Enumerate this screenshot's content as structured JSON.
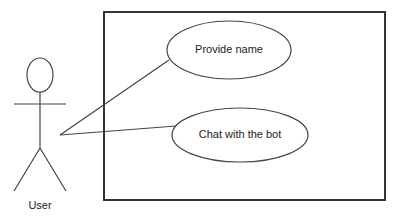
{
  "diagram": {
    "type": "use-case",
    "system_boundary": {
      "x": 104,
      "y": 12,
      "width": 281,
      "height": 188
    },
    "actor": {
      "label": "User",
      "head": {
        "cx": 40,
        "cy": 75,
        "rx": 13,
        "ry": 17
      },
      "arms": {
        "x1": 14,
        "y1": 104,
        "x2": 66,
        "y2": 104
      },
      "body": {
        "x1": 40,
        "y1": 92,
        "x2": 40,
        "y2": 148
      },
      "left_leg": {
        "x1": 40,
        "y1": 148,
        "x2": 14,
        "y2": 191
      },
      "right_leg": {
        "x1": 40,
        "y1": 148,
        "x2": 66,
        "y2": 191
      }
    },
    "use_cases": [
      {
        "label": "Provide name",
        "cx": 229,
        "cy": 50,
        "rx": 62,
        "ry": 29
      },
      {
        "label": "Chat with the bot",
        "cx": 240,
        "cy": 135,
        "rx": 68,
        "ry": 27
      }
    ],
    "associations": [
      {
        "from": "User",
        "to": "Provide name",
        "x1": 60,
        "y1": 135,
        "x2": 169,
        "y2": 60
      },
      {
        "from": "User",
        "to": "Chat with the bot",
        "x1": 60,
        "y1": 135,
        "x2": 176,
        "y2": 126
      }
    ],
    "colors": {
      "stroke": "#333333",
      "text": "#222222",
      "background": "#ffffff"
    }
  }
}
